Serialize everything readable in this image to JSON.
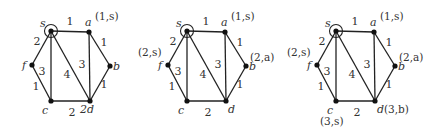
{
  "figure": {
    "nodes": [
      "s",
      "a",
      "b",
      "d",
      "c",
      "f"
    ],
    "source": "s",
    "edges": [
      {
        "from": "s",
        "to": "a",
        "weight": "1"
      },
      {
        "from": "s",
        "to": "f",
        "weight": "2"
      },
      {
        "from": "s",
        "to": "c",
        "weight": "3"
      },
      {
        "from": "s",
        "to": "d",
        "weight": "4"
      },
      {
        "from": "a",
        "to": "d",
        "weight": "3"
      },
      {
        "from": "a",
        "to": "b",
        "weight": "1"
      },
      {
        "from": "b",
        "to": "d",
        "weight": "1"
      },
      {
        "from": "f",
        "to": "c",
        "weight": "1"
      },
      {
        "from": "c",
        "to": "d",
        "weight": "2"
      }
    ],
    "graphs": [
      {
        "name": "stage-1",
        "node_labels": {
          "s": "s",
          "a": "a",
          "b": "b",
          "d": "2d",
          "c": "c",
          "f": "f"
        },
        "annotations": {
          "a": "(1,s)"
        }
      },
      {
        "name": "stage-2",
        "node_labels": {
          "s": "s",
          "a": "a",
          "b": "b",
          "d": "d",
          "c": "c",
          "f": "f"
        },
        "annotations": {
          "a": "(1,s)",
          "f": "(2,s)",
          "b": "(2,a)"
        }
      },
      {
        "name": "stage-3",
        "node_labels": {
          "s": "s",
          "a": "a",
          "b": "b",
          "d": "d",
          "c": "c",
          "f": "f"
        },
        "annotations": {
          "a": "(1,s)",
          "f": "(2,s)",
          "b": "(2,a)",
          "d": "(3,b)",
          "c": "(3,s)"
        }
      }
    ]
  }
}
